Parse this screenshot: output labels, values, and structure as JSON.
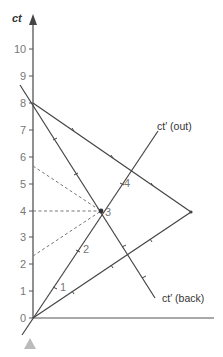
{
  "diagram": {
    "axis_title": "ct",
    "y_ticks": [
      "0",
      "1",
      "2",
      "3",
      "4",
      "5",
      "6",
      "7",
      "8",
      "9",
      "10"
    ],
    "lines": {
      "out_label": "ct′ (out)",
      "back_label": "ct′ (back)"
    },
    "event_labels": [
      "1",
      "2",
      "3",
      "4"
    ],
    "colors": {
      "axis": "#555555",
      "worldline": "#444444",
      "dashed": "#777777",
      "marker": "#bbbbbb"
    },
    "marker_icon": "triangle-up-icon"
  }
}
